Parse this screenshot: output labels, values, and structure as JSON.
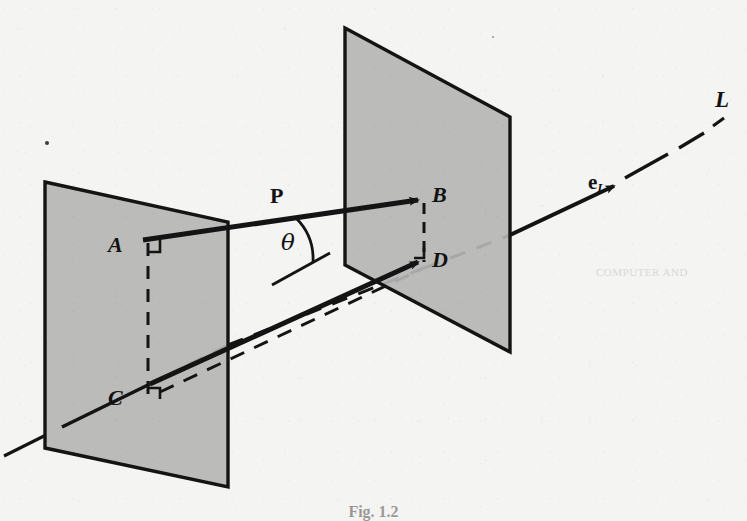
{
  "figure": {
    "caption": "Fig. 1.2",
    "background_color": "#f4f4f2",
    "ink_color": "#141414",
    "plane_fill_color": "#b6b6b6",
    "plane_edge_color": "#141414"
  },
  "labels": {
    "point_a": "A",
    "point_b": "B",
    "point_c": "C",
    "point_d": "D",
    "vector_p": "P",
    "angle_theta": "θ",
    "unit_vector_e": "e",
    "unit_vector_e_subscript": "L",
    "line_l": "L"
  },
  "elements": {
    "left_plane_name": "left-plane",
    "right_plane_name": "right-plane",
    "line_name": "line-L",
    "vector_p_name": "vector-P",
    "vector_ad_name": "vector-AD",
    "unit_vector_name": "unit-vector-eL",
    "angle_arc_name": "angle-arc-theta",
    "dashed_ab_name": "dashed-segment-AC",
    "dashed_bd_name": "dashed-segment-BD",
    "dashed_cd_name": "dashed-segment-CD"
  },
  "ghost_text": {
    "right_bleed": "COMPUTER AND",
    "left_bleed": ""
  },
  "geometry_notes": {
    "left_plane_points": "45,182 228,222 228,487 45,448",
    "right_plane_points": "345,28 510,117 510,352 345,265",
    "line_L_start": "0,455",
    "line_L_end": "710,108"
  }
}
